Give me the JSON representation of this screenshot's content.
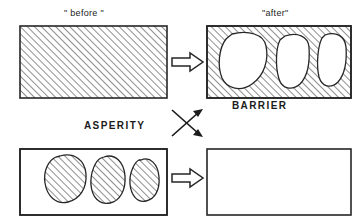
{
  "diagram": {
    "stroke_color": "#262626",
    "hatch_color": "#3a3a3a",
    "background_color": "#ffffff",
    "labels": {
      "before": "\" before \"",
      "after": "\"after\"",
      "barrier": "BARRIER",
      "asperity": "ASPERITY"
    },
    "panels": [
      {
        "id": "top-left",
        "name": "before-panel",
        "fill": "hatched",
        "description": "Fully hatched rectangle",
        "x": 20,
        "y": 26,
        "width": 147,
        "height": 72,
        "inclusions": []
      },
      {
        "id": "top-right",
        "name": "after-panel",
        "fill": "hatched",
        "description": "Hatched rectangle containing three white voids",
        "x": 207,
        "y": 26,
        "width": 144,
        "height": 72,
        "inclusions": [
          "void-blob-1",
          "void-blob-2",
          "void-blob-3"
        ]
      },
      {
        "id": "bottom-left",
        "name": "asperity-panel",
        "fill": "plain",
        "description": "Plain rectangle containing three hatched asperity blobs",
        "x": 20,
        "y": 149,
        "width": 147,
        "height": 66,
        "inclusions": [
          "asperity-blob-1",
          "asperity-blob-2",
          "asperity-blob-3"
        ]
      },
      {
        "id": "bottom-right",
        "name": "empty-panel",
        "fill": "plain",
        "description": "Empty plain rectangle",
        "x": 207,
        "y": 149,
        "width": 144,
        "height": 66,
        "inclusions": []
      }
    ],
    "block_arrows": [
      {
        "id": "top-arrow",
        "name": "transform-arrow-top",
        "direction": "right",
        "x": 172,
        "y": 55
      },
      {
        "id": "bottom-arrow",
        "name": "transform-arrow-bottom",
        "direction": "right",
        "x": 172,
        "y": 172
      }
    ],
    "cross_arrows": {
      "name": "crossing-arrows",
      "description": "Two thin arrows crossing in an X, both heads on the right",
      "arrow_up_right": {
        "from": [
          172,
          135
        ],
        "to": [
          204,
          110
        ]
      },
      "arrow_down_right": {
        "from": [
          172,
          110
        ],
        "to": [
          204,
          135
        ]
      }
    },
    "hatch": {
      "angle_degrees": 45,
      "spacing_px": 5,
      "line_width_px": 1.1
    }
  }
}
